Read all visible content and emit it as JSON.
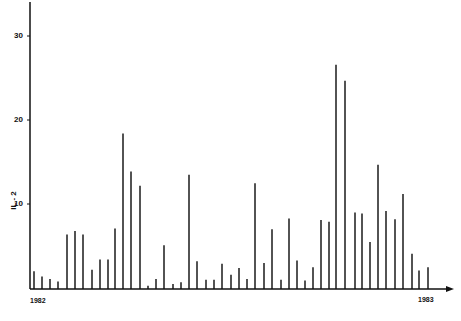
{
  "chart_data": {
    "type": "bar",
    "title": "",
    "xlabel": "",
    "ylabel": "IL-2",
    "ylim": [
      0,
      34
    ],
    "yticks": [
      10,
      20,
      30
    ],
    "x_start_label": "1982",
    "x_end_label": "1983",
    "grid": false,
    "legend": null,
    "x_positions": [
      34,
      42,
      50,
      58,
      67,
      75,
      83,
      92,
      100,
      108,
      115,
      123,
      131,
      140,
      148,
      156,
      164,
      173,
      181,
      189,
      197,
      206,
      214,
      222,
      231,
      239,
      247,
      255,
      264,
      272,
      281,
      289,
      297,
      305,
      313,
      321,
      329,
      336,
      345,
      355,
      362,
      370,
      378,
      386,
      395,
      403,
      412,
      419,
      428
    ],
    "values": [
      2.1,
      1.5,
      1.2,
      0.9,
      6.5,
      6.9,
      6.5,
      2.3,
      3.5,
      3.5,
      7.2,
      18.5,
      14.0,
      12.3,
      0.4,
      1.2,
      5.2,
      0.6,
      0.8,
      13.6,
      3.3,
      1.1,
      1.1,
      3.0,
      1.7,
      2.5,
      1.2,
      12.6,
      3.1,
      7.1,
      1.1,
      8.4,
      3.4,
      1.0,
      2.6,
      8.2,
      8.0,
      26.7,
      24.8,
      9.1,
      9.0,
      5.6,
      14.8,
      9.3,
      8.3,
      11.3,
      4.2,
      2.2,
      2.6
    ]
  },
  "axis": {
    "y_tick_labels": [
      "30",
      "20",
      "10"
    ],
    "y_label": "IL - 2",
    "x_left_label": "1982",
    "x_right_label": "1983"
  }
}
